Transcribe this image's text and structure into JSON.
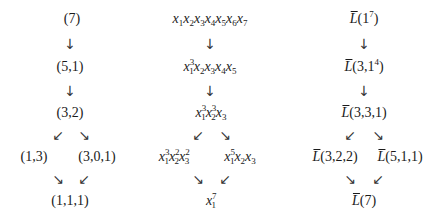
{
  "diagrams": [
    {
      "name": "partitions",
      "nodes": {
        "n1": "(7)",
        "n2": "(5,1)",
        "n3": "(3,2)",
        "n4a": "(1,3)",
        "n4b": "(3,0,1)",
        "n5": "(1,1,1)"
      }
    },
    {
      "name": "monomials",
      "nodes": {
        "n1": "x1x2x3x4x5x6x7",
        "n2": "x1^3 x2x3x4x5",
        "n3": "x1^3 x2^3 x3",
        "n4a": "x1^3 x2^2 x3^2",
        "n4b": "x1^5 x2x3",
        "n5": "x1^7"
      }
    },
    {
      "name": "L-bar modules",
      "nodes": {
        "n1": "L̄(1^7)",
        "n2": "L̄(3,1^4)",
        "n3": "L̄(3,3,1)",
        "n4a": "L̄(3,2,2)",
        "n4b": "L̄(5,1,1)",
        "n5": "L̄(7)"
      }
    }
  ],
  "text": {
    "c1": {
      "n1": "(7)",
      "n2": "(5,1)",
      "n3": "(3,2)",
      "n4a": "(1,3)",
      "n4b": "(3,0,1)",
      "n5": "(1,1,1)"
    },
    "c3": {
      "L": "L",
      "n1": "(1",
      "n1e": "7",
      "n1c": ")",
      "n2": "(3,1",
      "n2e": "4",
      "n2c": ")",
      "n3": "(3,3,1)",
      "n4a": "(3,2,2)",
      "n4b": "(5,1,1)",
      "n5": "(7)"
    },
    "x": "x",
    "idx": {
      "1": "1",
      "2": "2",
      "3": "3",
      "4": "4",
      "5": "5",
      "6": "6",
      "7": "7"
    },
    "exp": {
      "2": "2",
      "3": "3",
      "5": "5",
      "7": "7"
    }
  },
  "arrows": {
    "down": "↓",
    "sw": "↙",
    "se": "↘"
  }
}
